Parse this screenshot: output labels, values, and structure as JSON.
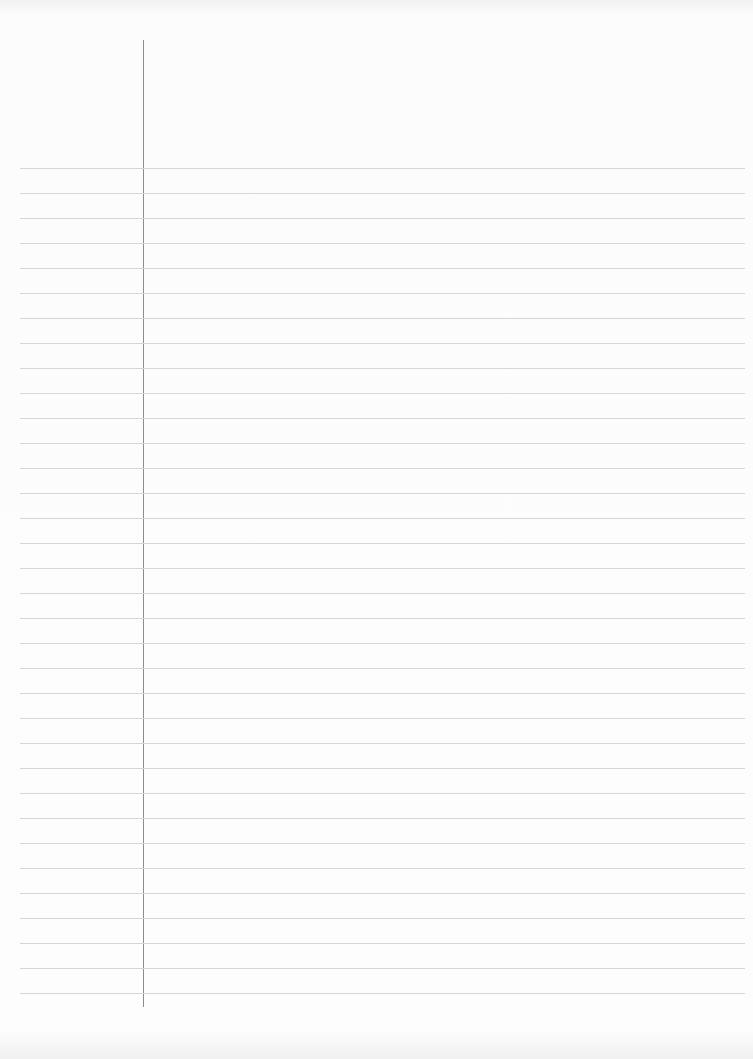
{
  "sheet": {
    "type": "lined-paper",
    "background_color": "#fbfbfb",
    "rule_color": "#d6d6d6",
    "margin_line_color": "#8c8c8c",
    "rule_count": 34,
    "first_rule_y": 168,
    "rule_spacing": 25,
    "rule_left_x": 20,
    "rule_right_x": 745,
    "margin_line_x": 143,
    "margin_line_top_y": 40,
    "margin_line_bottom_y": 1007
  }
}
